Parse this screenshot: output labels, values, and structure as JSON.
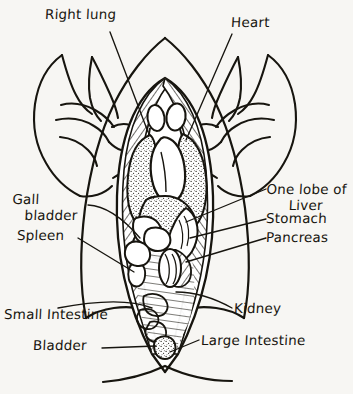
{
  "figure": {
    "style": "handwritten pen-and-ink on off-white paper",
    "ink_color": "#17150f",
    "paper_color": "#f7f6f3"
  },
  "labels": {
    "right_lung": "Right lung",
    "heart": "Heart",
    "one_lobe_of": "One lobe of",
    "liver": "Liver",
    "stomach": "Stomach",
    "pancreas": "Pancreas",
    "gall": "Gall",
    "bladder_upper": "bladder",
    "spleen": "Spleen",
    "small_intestine": "Small Intestine",
    "kidney": "Kidney",
    "bladder": "Bladder",
    "large_intestine": "Large Intestine"
  },
  "organs": [
    {
      "name": "Right lung",
      "side": "left-of-figure",
      "label_x": 45,
      "label_y": 10
    },
    {
      "name": "Heart",
      "side": "right-of-figure",
      "label_x": 231,
      "label_y": 18
    },
    {
      "name": "One lobe of Liver",
      "side": "right",
      "label_x": 268,
      "label_y": 186
    },
    {
      "name": "Stomach",
      "side": "right",
      "label_x": 268,
      "label_y": 218
    },
    {
      "name": "Pancreas",
      "side": "right",
      "label_x": 268,
      "label_y": 237
    },
    {
      "name": "Gall bladder",
      "side": "left",
      "label_x": 14,
      "label_y": 196
    },
    {
      "name": "Spleen",
      "side": "left",
      "label_x": 18,
      "label_y": 233
    },
    {
      "name": "Small Intestine",
      "side": "left",
      "label_x": 5,
      "label_y": 310
    },
    {
      "name": "Bladder",
      "side": "left",
      "label_x": 34,
      "label_y": 341
    },
    {
      "name": "Kidney",
      "side": "right",
      "label_x": 233,
      "label_y": 305
    },
    {
      "name": "Large Intestine",
      "side": "right",
      "label_x": 200,
      "label_y": 338
    }
  ]
}
